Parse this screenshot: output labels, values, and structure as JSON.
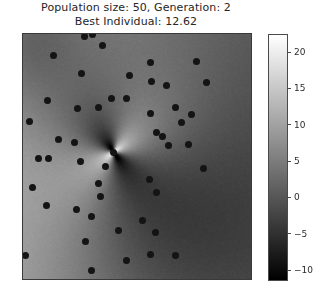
{
  "figure": {
    "background_color": "#ffffff",
    "width": 327,
    "height": 293
  },
  "title": {
    "line1": "Population size: 50, Generation: 2",
    "line2": "Best Individual: 12.62",
    "color": "#262626"
  },
  "chart_data": {
    "type": "heatmap",
    "title": "Population size: 50, Generation: 2\nBest Individual: 12.62",
    "xlabel": "",
    "ylabel": "",
    "grid": false,
    "legend": null,
    "colormap": "gray",
    "colorbar": {
      "position": "right",
      "ticks": [
        20,
        15,
        10,
        5,
        0,
        -5,
        -10
      ],
      "tick_labels": [
        "20",
        "15",
        "10",
        "5",
        "0",
        "−5",
        "−10"
      ],
      "vmin": -11.5,
      "vmax": 22.5,
      "white_value": 5.5
    },
    "xlim": [
      0,
      1
    ],
    "ylim": [
      0,
      1
    ],
    "surface": {
      "description": "Smooth scalar field with a saddle/pole singularity near the centre-left; bright ridges radiate up-left and down-left from the pole, dark lobes occupy the right half and the far upper-left corner.",
      "pole": {
        "x": 0.398,
        "y": 0.482
      },
      "noise_amplitude": 0.9
    },
    "scatter": {
      "name": "population",
      "count": 50,
      "marker": "circle",
      "color": "#141414",
      "size_px": 7,
      "points": [
        {
          "x": 0.27,
          "y": 0.012
        },
        {
          "x": 0.304,
          "y": 0.002
        },
        {
          "x": 0.348,
          "y": 0.046
        },
        {
          "x": 0.561,
          "y": 0.115
        },
        {
          "x": 0.76,
          "y": 0.112
        },
        {
          "x": 0.135,
          "y": 0.087
        },
        {
          "x": 0.465,
          "y": 0.168
        },
        {
          "x": 0.565,
          "y": 0.192
        },
        {
          "x": 0.255,
          "y": 0.163
        },
        {
          "x": 0.805,
          "y": 0.196
        },
        {
          "x": 0.63,
          "y": 0.21
        },
        {
          "x": 0.452,
          "y": 0.262
        },
        {
          "x": 0.39,
          "y": 0.262
        },
        {
          "x": 0.108,
          "y": 0.272
        },
        {
          "x": 0.33,
          "y": 0.3
        },
        {
          "x": 0.668,
          "y": 0.3
        },
        {
          "x": 0.24,
          "y": 0.305
        },
        {
          "x": 0.56,
          "y": 0.324
        },
        {
          "x": 0.74,
          "y": 0.33
        },
        {
          "x": 0.028,
          "y": 0.356
        },
        {
          "x": 0.694,
          "y": 0.362
        },
        {
          "x": 0.585,
          "y": 0.404
        },
        {
          "x": 0.612,
          "y": 0.418
        },
        {
          "x": 0.155,
          "y": 0.43
        },
        {
          "x": 0.228,
          "y": 0.441
        },
        {
          "x": 0.64,
          "y": 0.455
        },
        {
          "x": 0.725,
          "y": 0.452
        },
        {
          "x": 0.398,
          "y": 0.482
        },
        {
          "x": 0.25,
          "y": 0.52
        },
        {
          "x": 0.362,
          "y": 0.54
        },
        {
          "x": 0.79,
          "y": 0.548
        },
        {
          "x": 0.33,
          "y": 0.61
        },
        {
          "x": 0.112,
          "y": 0.508
        },
        {
          "x": 0.068,
          "y": 0.508
        },
        {
          "x": 0.04,
          "y": 0.625
        },
        {
          "x": 0.555,
          "y": 0.595
        },
        {
          "x": 0.34,
          "y": 0.662
        },
        {
          "x": 0.585,
          "y": 0.648
        },
        {
          "x": 0.105,
          "y": 0.7
        },
        {
          "x": 0.235,
          "y": 0.715
        },
        {
          "x": 0.3,
          "y": 0.745
        },
        {
          "x": 0.525,
          "y": 0.76
        },
        {
          "x": 0.418,
          "y": 0.8
        },
        {
          "x": 0.58,
          "y": 0.812
        },
        {
          "x": 0.272,
          "y": 0.845
        },
        {
          "x": 0.56,
          "y": 0.898
        },
        {
          "x": 0.668,
          "y": 0.905
        },
        {
          "x": 0.452,
          "y": 0.925
        },
        {
          "x": 0.01,
          "y": 0.905
        },
        {
          "x": 0.3,
          "y": 0.965
        }
      ]
    }
  }
}
